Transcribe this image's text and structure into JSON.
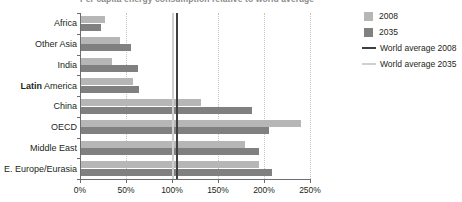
{
  "chart_data": {
    "type": "bar",
    "orientation": "horizontal",
    "title": "Per capita energy consumption relative to world average",
    "categories": [
      "Africa",
      "Other Asia",
      "India",
      "Latin America",
      "China",
      "OECD",
      "Middle East",
      "E. Europe/Eurasia"
    ],
    "series": [
      {
        "name": "2008",
        "color": "#b6b6b6",
        "values": [
          26,
          42,
          34,
          56,
          130,
          239,
          178,
          193
        ]
      },
      {
        "name": "2035",
        "color": "#808080",
        "values": [
          22,
          54,
          62,
          63,
          186,
          204,
          193,
          208
        ]
      }
    ],
    "reference_lines": [
      {
        "name": "World average 2008",
        "value": 100,
        "color": "#3f3f3f"
      },
      {
        "name": "World average 2035",
        "value": 100,
        "color": "#cfcfcf"
      }
    ],
    "xlabel": "",
    "ylabel": "",
    "xlim": [
      0,
      250
    ],
    "x_ticks": [
      0,
      50,
      100,
      150,
      200,
      250
    ],
    "x_tick_labels": [
      "0%",
      "50%",
      "100%",
      "150%",
      "200%",
      "250%"
    ],
    "grid": "vertical-dotted",
    "legend_position": "right",
    "bold_category": "Latin"
  },
  "legend": {
    "entries": [
      {
        "label": "2008",
        "marker": "square",
        "color": "#b6b6b6"
      },
      {
        "label": "2035",
        "marker": "square",
        "color": "#808080"
      },
      {
        "label": "World average 2008",
        "marker": "line",
        "color": "#3f3f3f"
      },
      {
        "label": "World average 2035",
        "marker": "line",
        "color": "#cfcfcf"
      }
    ]
  }
}
